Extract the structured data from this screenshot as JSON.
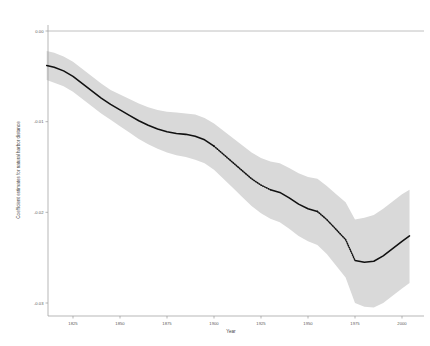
{
  "chart_data": {
    "type": "line",
    "title": "",
    "subtitle": "",
    "xlabel": "Year",
    "ylabel": "Coefficient estimates for natural harbor distance",
    "xlim": [
      1810,
      2005
    ],
    "ylim": [
      -0.032,
      0.0022
    ],
    "grid": false,
    "legend": null,
    "xticks": [
      1825,
      1850,
      1875,
      1900,
      1925,
      1950,
      1975,
      2000
    ],
    "xticklabels": [
      "1825",
      "1850",
      "1875",
      "1900",
      "1925",
      "1950",
      "1975",
      "2000"
    ],
    "yticks": [
      0.0,
      -0.01,
      -0.02,
      -0.03
    ],
    "yticklabels": [
      "0.00",
      "-0.01",
      "-0.02",
      "-0.03"
    ],
    "annotations": [
      {
        "name": "zero-reference-line",
        "y": 0.0,
        "style": "solid-gray-horizontal-rule"
      }
    ],
    "series": [
      {
        "name": "Coefficient estimate",
        "style": "solid black line with dotted mid-segment",
        "color": "#000000",
        "x": [
          1811,
          1815,
          1820,
          1825,
          1830,
          1835,
          1840,
          1845,
          1850,
          1855,
          1860,
          1865,
          1870,
          1875,
          1880,
          1885,
          1890,
          1895,
          1900,
          1905,
          1910,
          1915,
          1920,
          1925,
          1930,
          1935,
          1940,
          1945,
          1950,
          1955,
          1960,
          1965,
          1970,
          1975,
          1980,
          1985,
          1990,
          1995,
          2000,
          2004
        ],
        "y": [
          -0.0038,
          -0.004,
          -0.0044,
          -0.005,
          -0.0058,
          -0.0066,
          -0.0074,
          -0.0081,
          -0.0087,
          -0.0093,
          -0.0099,
          -0.0104,
          -0.0108,
          -0.0111,
          -0.0113,
          -0.0114,
          -0.0116,
          -0.012,
          -0.0127,
          -0.0136,
          -0.0145,
          -0.0154,
          -0.0163,
          -0.017,
          -0.0175,
          -0.0178,
          -0.0184,
          -0.0191,
          -0.0196,
          -0.0199,
          -0.0208,
          -0.0219,
          -0.023,
          -0.0253,
          -0.0255,
          -0.0254,
          -0.0248,
          -0.024,
          -0.0232,
          -0.0226
        ]
      },
      {
        "name": "Confidence interval upper bound",
        "style": "gray shaded band",
        "color": "#d9d9d9",
        "x": [
          1811,
          1815,
          1820,
          1825,
          1830,
          1835,
          1840,
          1845,
          1850,
          1855,
          1860,
          1865,
          1870,
          1875,
          1880,
          1885,
          1890,
          1895,
          1900,
          1905,
          1910,
          1915,
          1920,
          1925,
          1930,
          1935,
          1940,
          1945,
          1950,
          1955,
          1960,
          1965,
          1970,
          1975,
          1980,
          1985,
          1990,
          1995,
          2000,
          2004
        ],
        "y": [
          -0.0022,
          -0.0024,
          -0.0028,
          -0.0034,
          -0.0042,
          -0.005,
          -0.0058,
          -0.0065,
          -0.007,
          -0.0075,
          -0.008,
          -0.0084,
          -0.0087,
          -0.0089,
          -0.009,
          -0.0091,
          -0.0092,
          -0.0096,
          -0.0102,
          -0.011,
          -0.0118,
          -0.0126,
          -0.0134,
          -0.014,
          -0.0144,
          -0.0146,
          -0.0151,
          -0.0157,
          -0.0161,
          -0.0163,
          -0.0171,
          -0.018,
          -0.0189,
          -0.0208,
          -0.0206,
          -0.0203,
          -0.0196,
          -0.0188,
          -0.018,
          -0.0175
        ]
      },
      {
        "name": "Confidence interval lower bound",
        "style": "gray shaded band",
        "color": "#d9d9d9",
        "x": [
          1811,
          1815,
          1820,
          1825,
          1830,
          1835,
          1840,
          1845,
          1850,
          1855,
          1860,
          1865,
          1870,
          1875,
          1880,
          1885,
          1890,
          1895,
          1900,
          1905,
          1910,
          1915,
          1920,
          1925,
          1930,
          1935,
          1940,
          1945,
          1950,
          1955,
          1960,
          1965,
          1970,
          1975,
          1980,
          1985,
          1990,
          1995,
          2000,
          2004
        ],
        "y": [
          -0.0054,
          -0.0057,
          -0.0061,
          -0.0067,
          -0.0075,
          -0.0083,
          -0.0091,
          -0.0098,
          -0.0105,
          -0.0112,
          -0.0119,
          -0.0125,
          -0.013,
          -0.0134,
          -0.0137,
          -0.0139,
          -0.0142,
          -0.0146,
          -0.0153,
          -0.0163,
          -0.0173,
          -0.0183,
          -0.0193,
          -0.0201,
          -0.0207,
          -0.0211,
          -0.0218,
          -0.0226,
          -0.0232,
          -0.0236,
          -0.0246,
          -0.0259,
          -0.0272,
          -0.03,
          -0.0304,
          -0.0305,
          -0.03,
          -0.0292,
          -0.0284,
          -0.0278
        ]
      }
    ]
  }
}
